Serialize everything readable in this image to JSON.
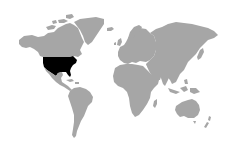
{
  "map": {
    "type": "world-map",
    "background_color": "#ffffff",
    "land_color": "#a6a6a6",
    "highlight_color": "#000000",
    "highlighted_countries": [
      "United States"
    ],
    "regions": [
      {
        "name": "North America",
        "highlighted": false
      },
      {
        "name": "United States",
        "highlighted": true
      },
      {
        "name": "Greenland",
        "highlighted": false
      },
      {
        "name": "Central America",
        "highlighted": false
      },
      {
        "name": "South America",
        "highlighted": false
      },
      {
        "name": "Europe",
        "highlighted": false
      },
      {
        "name": "Africa",
        "highlighted": false
      },
      {
        "name": "Asia",
        "highlighted": false
      },
      {
        "name": "Australia",
        "highlighted": false
      },
      {
        "name": "New Zealand",
        "highlighted": false
      }
    ]
  }
}
